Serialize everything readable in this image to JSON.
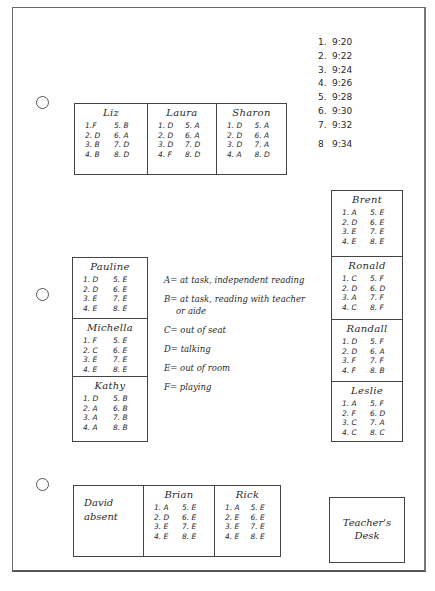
{
  "time_intervals": [
    {
      "n": "1.",
      "time": "9:20"
    },
    {
      "n": "2.",
      "time": "9:22"
    },
    {
      "n": "3.",
      "time": "9:24"
    },
    {
      "n": "4.",
      "time": "9:26"
    },
    {
      "n": "5.",
      "time": "9:28"
    },
    {
      "n": "6.",
      "time": "9:30"
    },
    {
      "n": "7.",
      "time": "9:32"
    },
    {
      "n": "8",
      "time": "9:34"
    }
  ],
  "legend": [
    {
      "code": "A",
      "text": "A= at task, independent reading"
    },
    {
      "code": "B",
      "text": "B= at task, reading with teacher",
      "continuation": "or aide"
    },
    {
      "code": "C",
      "text": "C= out of seat"
    },
    {
      "code": "D",
      "text": "D= talking"
    },
    {
      "code": "E",
      "text": "E= out of room"
    },
    {
      "code": "F",
      "text": "F= playing"
    }
  ],
  "top_row": [
    {
      "name": "Liz",
      "codes": [
        "1.F",
        "5. B",
        "2. D",
        "6. A",
        "3. B",
        "7. D",
        "4. B",
        "8. D"
      ]
    },
    {
      "name": "Laura",
      "codes": [
        "1. D",
        "5. A",
        "2. D",
        "6. A",
        "3. D",
        "7. D",
        "4. F",
        "8. D"
      ]
    },
    {
      "name": "Sharon",
      "codes": [
        "1. D",
        "5. A",
        "2. D",
        "6. A",
        "3. D",
        "7. A",
        "4. A",
        "8. D"
      ]
    }
  ],
  "left_column": [
    {
      "name": "Pauline",
      "codes": [
        "1. D",
        "5. E",
        "2. D",
        "6. E",
        "3. E",
        "7. E",
        "4. E",
        "8. E"
      ]
    },
    {
      "name": "Michella",
      "codes": [
        "1. F",
        "5. E",
        "2. C",
        "6. E",
        "3. E",
        "7. E",
        "4. E",
        "8. E"
      ]
    },
    {
      "name": "Kathy",
      "codes": [
        "1. D",
        "5. B",
        "2. A",
        "6. B",
        "3. A",
        "7. B",
        "4. A",
        "8. B"
      ]
    }
  ],
  "right_column": [
    {
      "name": "Brent",
      "codes": [
        "1. A",
        "5. E",
        "2. D",
        "6. E",
        "3. E",
        "7. E",
        "4. E",
        "8. E"
      ]
    },
    {
      "name": "Ronald",
      "codes": [
        "1. C",
        "5. F",
        "2. D",
        "6. D",
        "3. A",
        "7. F",
        "4. C",
        "8. F"
      ]
    },
    {
      "name": "Randall",
      "codes": [
        "1. D",
        "5. F",
        "2. D",
        "6. A",
        "3. F",
        "7. F",
        "4. F",
        "8. B"
      ]
    },
    {
      "name": "Leslie",
      "codes": [
        "1. A",
        "5. F",
        "2. F",
        "6. D",
        "3. C",
        "7. A",
        "4. C",
        "8. C"
      ]
    }
  ],
  "bottom_row": {
    "absent": {
      "name": "David",
      "note": "absent"
    },
    "students": [
      {
        "name": "Brian",
        "codes": [
          "1. A",
          "5. E",
          "2. D",
          "6. E",
          "3. E",
          "7. E",
          "4. E",
          "8. E"
        ]
      },
      {
        "name": "Rick",
        "codes": [
          "1. A",
          "5. E",
          "2. E",
          "6. E",
          "3. E",
          "7. E",
          "4. E",
          "8. E"
        ]
      }
    ]
  },
  "teacher_desk": {
    "line1": "Teacher's",
    "line2": "Desk"
  }
}
